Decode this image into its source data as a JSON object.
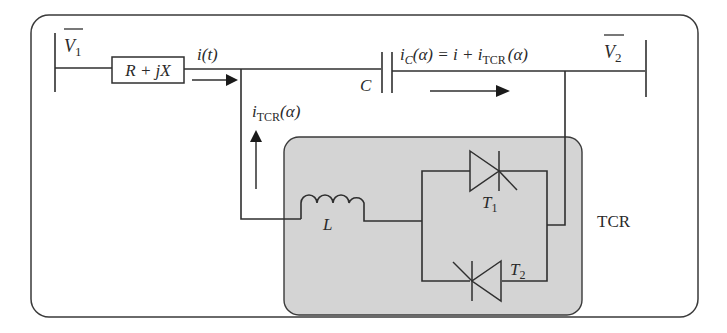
{
  "diagram": {
    "nodes": {
      "bus1": {
        "label": "V",
        "subscript": "1",
        "overline": true
      },
      "bus2": {
        "label": "V",
        "subscript": "2",
        "overline": true
      },
      "impedance": {
        "label": "R + jX"
      },
      "capacitor": {
        "label": "C"
      },
      "inductor": {
        "label": "L"
      },
      "thyristor1": {
        "label": "T",
        "subscript": "1"
      },
      "thyristor2": {
        "label": "T",
        "subscript": "2"
      },
      "tcr_block": {
        "label": "TCR"
      }
    },
    "currents": {
      "line_current": {
        "label": "i(t)"
      },
      "tcr_current": {
        "label": "i",
        "subscript": "TCR",
        "suffix": "(α)"
      },
      "cap_current": {
        "label_prefix": "i",
        "prefix_sub": "C",
        "middle": "(α) = i + i",
        "mid_sub": "TCR",
        "suffix": "(α)"
      }
    },
    "colors": {
      "line": "#2f2f2f",
      "tcr_fill": "#d4d4d4",
      "background": "#ffffff"
    }
  }
}
